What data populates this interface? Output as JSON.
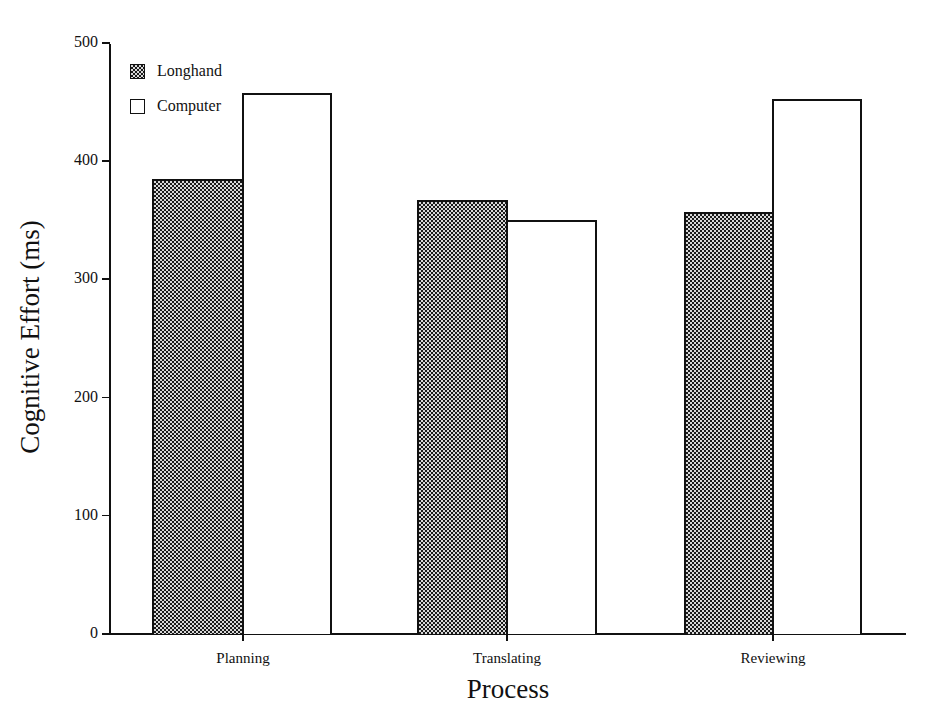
{
  "chart_data": {
    "type": "bar",
    "title": "",
    "xlabel": "Process",
    "ylabel": "Cognitive Effort (ms)",
    "categories": [
      "Planning",
      "Translating",
      "Reviewing"
    ],
    "series": [
      {
        "name": "Longhand",
        "fill": "crosshatch-pattern",
        "values": [
          385,
          367,
          357
        ]
      },
      {
        "name": "Computer",
        "fill": "#ffffff",
        "values": [
          458,
          350,
          453
        ]
      }
    ],
    "ylim": [
      0,
      500
    ],
    "yticks": [
      0,
      100,
      200,
      300,
      400,
      500
    ],
    "grid": false,
    "legend_position": "upper-left"
  },
  "legend": {
    "items": [
      {
        "label": "Longhand"
      },
      {
        "label": "Computer"
      }
    ]
  },
  "axes": {
    "y_tick_labels": [
      "0",
      "100",
      "200",
      "300",
      "400",
      "500"
    ],
    "x_tick_labels": [
      "Planning",
      "Translating",
      "Reviewing"
    ],
    "xlabel": "Process",
    "ylabel": "Cognitive Effort (ms)"
  }
}
